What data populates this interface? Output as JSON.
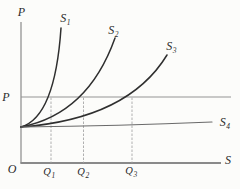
{
  "figure": {
    "axes": {
      "y_axis_label": "P",
      "x_axis_label": "S",
      "origin_label": "O",
      "price_level_label": "P"
    },
    "curves": {
      "s1": {
        "base": "S",
        "sub": "1"
      },
      "s2": {
        "base": "S",
        "sub": "2"
      },
      "s3": {
        "base": "S",
        "sub": "3"
      },
      "s4": {
        "base": "S",
        "sub": "4"
      }
    },
    "quantities": {
      "q1": {
        "base": "Q",
        "sub": "1"
      },
      "q2": {
        "base": "Q",
        "sub": "2"
      },
      "q3": {
        "base": "Q",
        "sub": "3"
      }
    },
    "colors": {
      "curve": "#2f2f2f",
      "flat_curve": "#6a6a6a",
      "axis": "#8a8a8a",
      "price_line": "#949494",
      "guide_line": "#b0b0b0",
      "background": "#fcfcfa"
    }
  }
}
